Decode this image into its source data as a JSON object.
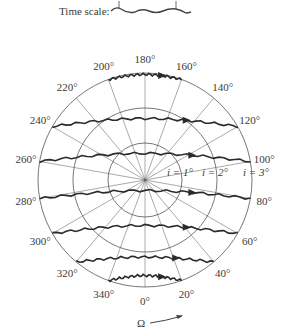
{
  "time_scale": {
    "label": "Time scale:"
  },
  "polar": {
    "center": [
      145,
      180
    ],
    "radii": [
      37,
      72,
      107
    ],
    "circle_labels": [
      "i = 1°",
      "i = 2°",
      "i = 3°"
    ],
    "spoke_step_deg": 20,
    "angle_labels": [
      "0°",
      "20°",
      "40°",
      "60°",
      "80°",
      "100°",
      "120°",
      "140°",
      "160°",
      "180°",
      "200°",
      "220°",
      "240°",
      "260°",
      "280°",
      "300°",
      "320°",
      "340°"
    ],
    "axis_label": "Ω",
    "line_color": "#555555",
    "trajectory_color": "#2a2a2a"
  },
  "trajectories": [
    {
      "from": "200°",
      "to": "160°"
    },
    {
      "from": "240°",
      "to": "120°"
    },
    {
      "from": "260°",
      "to": "100°"
    },
    {
      "from": "280°",
      "to": "80°"
    },
    {
      "from": "300°",
      "to": "60°"
    },
    {
      "from": "320°",
      "to": "40°"
    },
    {
      "from": "340°",
      "to": "20°"
    }
  ]
}
